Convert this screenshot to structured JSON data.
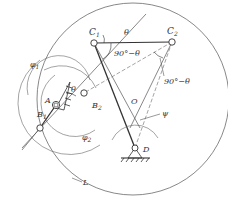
{
  "diagram": {
    "type": "mechanism-kinematic-diagram",
    "colors": {
      "line": "#333333",
      "thin": "#555555",
      "background": "#ffffff"
    },
    "points": {
      "C1": {
        "label": "C",
        "sub": "1"
      },
      "C2": {
        "label": "C",
        "sub": "2"
      },
      "A": {
        "label": "A"
      },
      "B1": {
        "label": "B",
        "sub": "1"
      },
      "B2": {
        "label": "B",
        "sub": "2"
      },
      "O": {
        "label": "O"
      },
      "D": {
        "label": "D"
      }
    },
    "angles": {
      "theta_top": "θ",
      "theta_A": "θ",
      "c1_angle": "90°−θ",
      "c2_angle": "90°−θ",
      "psi": "ψ",
      "phi1": {
        "label": "φ",
        "sub": "1"
      },
      "phi2": {
        "label": "φ",
        "sub": "2"
      }
    },
    "curves": {
      "L": {
        "label": "L"
      }
    }
  }
}
